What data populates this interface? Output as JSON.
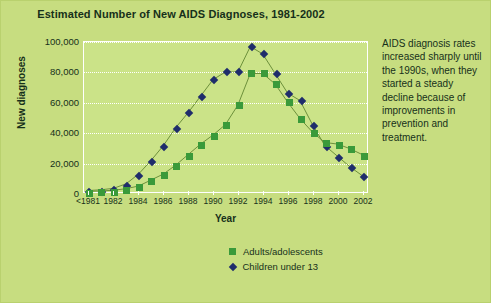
{
  "figure": {
    "background_color": "#c7dd80",
    "plot_background_color": "#cbe388",
    "border_color": "#b9d16e"
  },
  "caption": {
    "text": "AIDS diagnosis rates increased sharply until the 1990s, when they started a steady decline because of improvements in prevention and treatment."
  },
  "legend": {
    "position": "bottom",
    "items": [
      {
        "label": "Adults/adolescents",
        "marker": "square",
        "color": "#3a9a3a"
      },
      {
        "label": "Children under 13",
        "marker": "diamond",
        "color": "#1f2d6b"
      }
    ]
  },
  "chart_data": {
    "type": "line",
    "title": "Estimated Number of New AIDS Diagnoses, 1981-2002",
    "xlabel": "Year",
    "ylabel": "New diagnoses",
    "grid": true,
    "ylim": [
      0,
      100000
    ],
    "yticks": [
      0,
      20000,
      40000,
      60000,
      80000,
      100000
    ],
    "ytick_labels": [
      "0",
      "20,000",
      "40,000",
      "60,000",
      "80,000",
      "100,000"
    ],
    "x": [
      "<1981",
      "1981",
      "1982",
      "1983",
      "1984",
      "1985",
      "1986",
      "1987",
      "1988",
      "1989",
      "1990",
      "1991",
      "1992",
      "1993",
      "1994",
      "1995",
      "1996",
      "1997",
      "1998",
      "1999",
      "2000",
      "2001",
      "2002"
    ],
    "xtick_labels": [
      "<1981",
      "1982",
      "1984",
      "1986",
      "1988",
      "1990",
      "1992",
      "1994",
      "1996",
      "1998",
      "2000",
      "2002"
    ],
    "series": [
      {
        "name": "Children under 13",
        "marker": "diamond",
        "color": "#1f2d6b",
        "values": [
          1000,
          1500,
          2500,
          5500,
          12000,
          21000,
          31000,
          43000,
          53000,
          64000,
          75000,
          80000,
          80000,
          97000,
          92000,
          79000,
          66000,
          61000,
          45000,
          31000,
          24000,
          17000,
          11000
        ]
      },
      {
        "name": "Adults/adolescents",
        "marker": "square",
        "color": "#3a9a3a",
        "values": [
          400,
          700,
          1200,
          2200,
          4000,
          8000,
          12000,
          18000,
          25000,
          32000,
          38000,
          45000,
          58000,
          79000,
          79000,
          72000,
          60000,
          49000,
          40000,
          33000,
          32000,
          29000,
          25000
        ]
      }
    ]
  }
}
